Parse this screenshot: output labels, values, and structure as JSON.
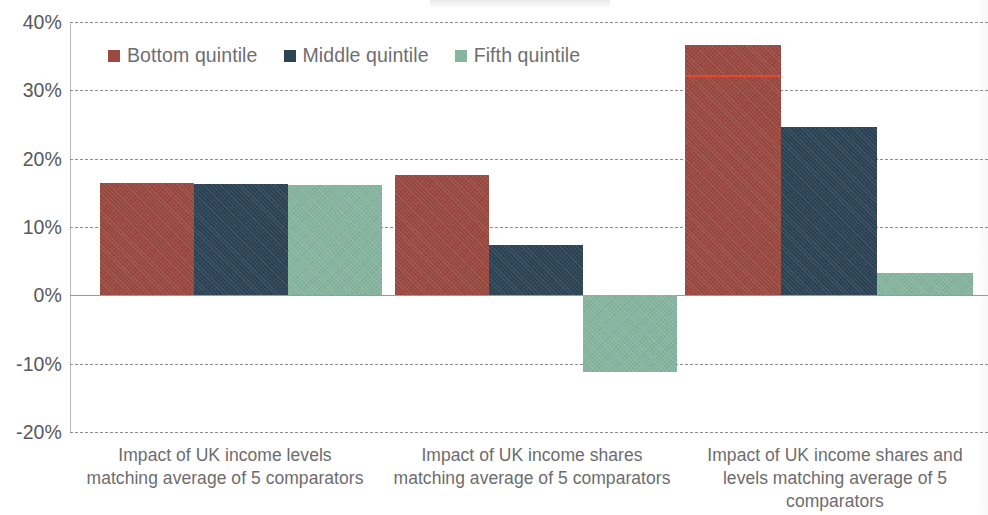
{
  "chart_data": {
    "type": "bar",
    "title": "",
    "xlabel": "",
    "ylabel": "",
    "ylim": [
      -20,
      40
    ],
    "y_tick_labels": [
      "40%",
      "30%",
      "20%",
      "10%",
      "0%",
      "-10%",
      "-20%"
    ],
    "y_tick_values": [
      40,
      30,
      20,
      10,
      0,
      -10,
      -20
    ],
    "grid": true,
    "legend_position": "top-left-inside",
    "categories": [
      "Impact of UK income levels matching average of 5 comparators",
      "Impact of UK income shares matching average of 5 comparators",
      "Impact of UK income shares and levels matching average of 5 comparators"
    ],
    "category_lines": [
      [
        "Impact of UK income levels",
        "matching average of 5 comparators"
      ],
      [
        "Impact of UK income shares",
        "matching average of 5 comparators"
      ],
      [
        "Impact of UK income shares and",
        "levels matching average of 5",
        "comparators"
      ]
    ],
    "series": [
      {
        "name": "Bottom quintile",
        "color": "#9a4a40",
        "values": [
          16.4,
          17.6,
          36.7
        ]
      },
      {
        "name": "Middle quintile",
        "color": "#2d4456",
        "values": [
          16.3,
          7.3,
          24.7
        ]
      },
      {
        "name": "Fifth quintile",
        "color": "#86b5a0",
        "values": [
          16.1,
          -11.2,
          3.2
        ]
      }
    ],
    "annotations": [
      {
        "type": "hline-on-bar",
        "group": 2,
        "series": 0,
        "value": 32.3,
        "color": "#e8462e"
      }
    ]
  },
  "legend": {
    "items": [
      {
        "label": "Bottom quintile",
        "color": "#9a4a40"
      },
      {
        "label": "Middle quintile",
        "color": "#2d4456"
      },
      {
        "label": "Fifth quintile",
        "color": "#86b5a0"
      }
    ]
  },
  "colors": {
    "bottom_quintile": "#9a4a40",
    "middle_quintile": "#2d4456",
    "fifth_quintile": "#86b5a0",
    "gridline": "#8d8d8d",
    "axis": "#b9b9b9",
    "tick_text": "#58585a",
    "category_text": "#6c6c6e",
    "legend_text": "#6e6e70",
    "annotation": "#e8462e",
    "background": "#ffffff"
  }
}
